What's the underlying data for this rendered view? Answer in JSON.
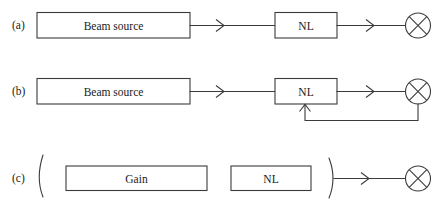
{
  "figure": {
    "background_color": "#ffffff",
    "stroke_color": "#3b3b3b",
    "text_color": "#1a1a1a"
  },
  "rows": [
    {
      "id": "a",
      "label": "(a)",
      "boxes": [
        {
          "name": "beam-source",
          "label": "Beam source"
        },
        {
          "name": "nl",
          "label": "NL"
        }
      ],
      "arrows": [
        {
          "name": "beam-source-to-nl",
          "glyph": "chevron-right-icon"
        },
        {
          "name": "nl-to-detector",
          "glyph": "chevron-right-icon"
        }
      ],
      "detector": {
        "name": "detector",
        "glyph": "circle-cross-icon"
      },
      "feedback": false,
      "mirrors": []
    },
    {
      "id": "b",
      "label": "(b)",
      "boxes": [
        {
          "name": "beam-source",
          "label": "Beam source"
        },
        {
          "name": "nl",
          "label": "NL"
        }
      ],
      "arrows": [
        {
          "name": "beam-source-to-nl",
          "glyph": "chevron-right-icon"
        },
        {
          "name": "nl-to-detector",
          "glyph": "chevron-right-icon"
        },
        {
          "name": "feedback-into-nl",
          "glyph": "arrow-up-icon"
        }
      ],
      "detector": {
        "name": "detector",
        "glyph": "circle-cross-icon"
      },
      "feedback": true,
      "mirrors": []
    },
    {
      "id": "c",
      "label": "(c)",
      "boxes": [
        {
          "name": "gain",
          "label": "Gain"
        },
        {
          "name": "nl",
          "label": "NL"
        }
      ],
      "arrows": [
        {
          "name": "cavity-output-to-detector",
          "glyph": "chevron-right-icon"
        }
      ],
      "detector": {
        "name": "detector",
        "glyph": "circle-cross-icon"
      },
      "feedback": false,
      "mirrors": [
        {
          "name": "left-cavity-mirror",
          "glyph": "arc-left-icon"
        },
        {
          "name": "right-cavity-mirror",
          "glyph": "arc-right-icon"
        }
      ]
    }
  ]
}
